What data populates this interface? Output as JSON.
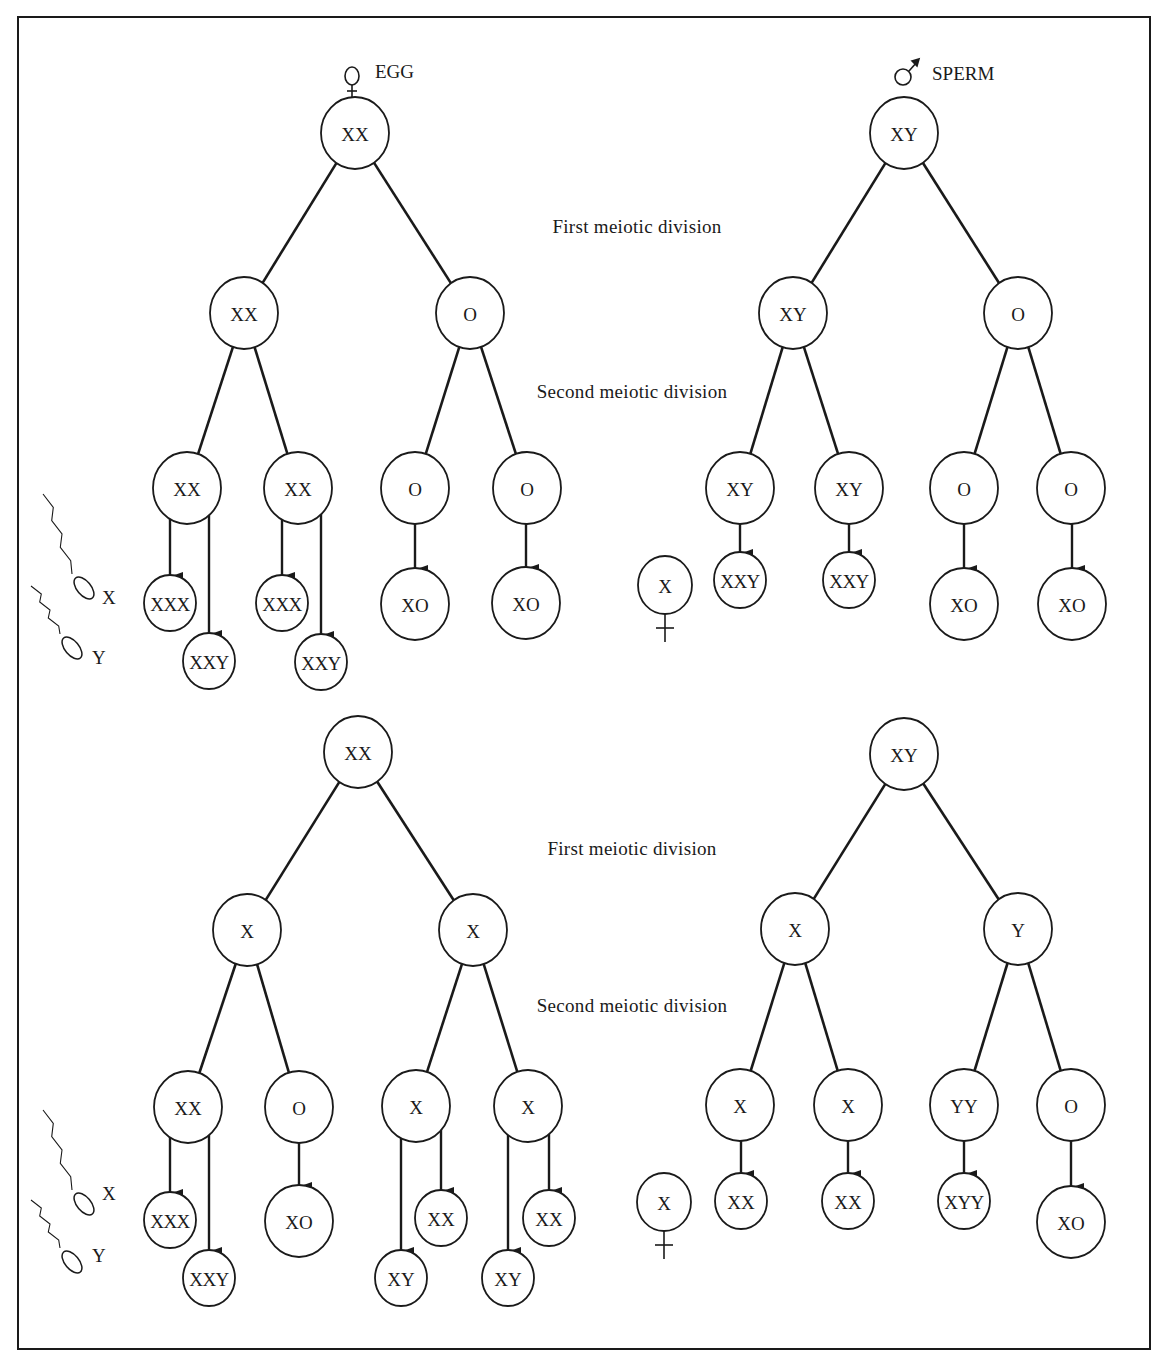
{
  "headers": {
    "egg": {
      "label": "EGG",
      "icon": "female-symbol",
      "x": 375,
      "y": 78
    },
    "sperm": {
      "label": "SPERM",
      "icon": "male-symbol",
      "x": 932,
      "y": 80
    }
  },
  "captions": [
    {
      "text": "First meiotic division",
      "x": 637,
      "y": 233
    },
    {
      "text": "Second meiotic division",
      "x": 632,
      "y": 398
    },
    {
      "text": "First meiotic division",
      "x": 632,
      "y": 855
    },
    {
      "text": "Second meiotic division",
      "x": 632,
      "y": 1012
    }
  ],
  "sperm_legend": [
    {
      "label": "X",
      "head_x": 84,
      "head_y": 588,
      "text_x": 102,
      "text_y": 604
    },
    {
      "label": "Y",
      "head_x": 72,
      "head_y": 648,
      "text_x": 92,
      "text_y": 664
    },
    {
      "label": "X",
      "head_x": 84,
      "head_y": 1204,
      "text_x": 102,
      "text_y": 1200
    },
    {
      "label": "Y",
      "head_x": 72,
      "head_y": 1262,
      "text_x": 92,
      "text_y": 1262
    }
  ],
  "female_ova": [
    {
      "label": "X",
      "x": 665,
      "y": 585,
      "r": 27
    },
    {
      "label": "X",
      "x": 664,
      "y": 1202,
      "r": 27
    }
  ],
  "trees": [
    {
      "name": "egg-nondisjunction-first-division",
      "nodes": [
        {
          "id": "r",
          "label": "XX",
          "x": 355,
          "y": 133,
          "r": 34
        },
        {
          "id": "a",
          "label": "XX",
          "x": 244,
          "y": 313,
          "r": 34
        },
        {
          "id": "b",
          "label": "O",
          "x": 470,
          "y": 313,
          "r": 34
        },
        {
          "id": "a1",
          "label": "XX",
          "x": 187,
          "y": 488,
          "r": 34
        },
        {
          "id": "a2",
          "label": "XX",
          "x": 298,
          "y": 488,
          "r": 34
        },
        {
          "id": "b1",
          "label": "O",
          "x": 415,
          "y": 488,
          "r": 34
        },
        {
          "id": "b2",
          "label": "O",
          "x": 527,
          "y": 488,
          "r": 34
        },
        {
          "id": "p1",
          "label": "XXX",
          "x": 170,
          "y": 603,
          "r": 26
        },
        {
          "id": "p2",
          "label": "XXY",
          "x": 209,
          "y": 661,
          "r": 26
        },
        {
          "id": "p3",
          "label": "XXX",
          "x": 282,
          "y": 603,
          "r": 26
        },
        {
          "id": "p4",
          "label": "XXY",
          "x": 321,
          "y": 662,
          "r": 26
        },
        {
          "id": "p5",
          "label": "XO",
          "x": 415,
          "y": 604,
          "r": 34
        },
        {
          "id": "p6",
          "label": "XO",
          "x": 526,
          "y": 603,
          "r": 34
        }
      ],
      "lines": [
        [
          "r",
          "a"
        ],
        [
          "r",
          "b"
        ],
        [
          "a",
          "a1"
        ],
        [
          "a",
          "a2"
        ],
        [
          "b",
          "b1"
        ],
        [
          "b",
          "b2"
        ]
      ],
      "arrows": [
        [
          "a1",
          "p1"
        ],
        [
          "a1",
          "p2"
        ],
        [
          "a2",
          "p3"
        ],
        [
          "a2",
          "p4"
        ],
        [
          "b1",
          "p5"
        ],
        [
          "b2",
          "p6"
        ]
      ]
    },
    {
      "name": "sperm-nondisjunction-first-division",
      "nodes": [
        {
          "id": "r",
          "label": "XY",
          "x": 904,
          "y": 133,
          "r": 34
        },
        {
          "id": "a",
          "label": "XY",
          "x": 793,
          "y": 313,
          "r": 34
        },
        {
          "id": "b",
          "label": "O",
          "x": 1018,
          "y": 313,
          "r": 34
        },
        {
          "id": "a1",
          "label": "XY",
          "x": 740,
          "y": 488,
          "r": 34
        },
        {
          "id": "a2",
          "label": "XY",
          "x": 849,
          "y": 488,
          "r": 34
        },
        {
          "id": "b1",
          "label": "O",
          "x": 964,
          "y": 488,
          "r": 34
        },
        {
          "id": "b2",
          "label": "O",
          "x": 1071,
          "y": 488,
          "r": 34
        },
        {
          "id": "p1",
          "label": "XXY",
          "x": 740,
          "y": 580,
          "r": 26
        },
        {
          "id": "p2",
          "label": "XXY",
          "x": 849,
          "y": 580,
          "r": 26
        },
        {
          "id": "p3",
          "label": "XO",
          "x": 964,
          "y": 604,
          "r": 34
        },
        {
          "id": "p4",
          "label": "XO",
          "x": 1072,
          "y": 604,
          "r": 34
        }
      ],
      "lines": [
        [
          "r",
          "a"
        ],
        [
          "r",
          "b"
        ],
        [
          "a",
          "a1"
        ],
        [
          "a",
          "a2"
        ],
        [
          "b",
          "b1"
        ],
        [
          "b",
          "b2"
        ]
      ],
      "arrows": [
        [
          "a1",
          "p1"
        ],
        [
          "a2",
          "p2"
        ],
        [
          "b1",
          "p3"
        ],
        [
          "b2",
          "p4"
        ]
      ]
    },
    {
      "name": "egg-nondisjunction-second-division",
      "nodes": [
        {
          "id": "r",
          "label": "XX",
          "x": 358,
          "y": 752,
          "r": 34
        },
        {
          "id": "a",
          "label": "X",
          "x": 247,
          "y": 930,
          "r": 34
        },
        {
          "id": "b",
          "label": "X",
          "x": 473,
          "y": 930,
          "r": 34
        },
        {
          "id": "a1",
          "label": "XX",
          "x": 188,
          "y": 1107,
          "r": 34
        },
        {
          "id": "a2",
          "label": "O",
          "x": 299,
          "y": 1107,
          "r": 34
        },
        {
          "id": "b1",
          "label": "X",
          "x": 416,
          "y": 1106,
          "r": 34
        },
        {
          "id": "b2",
          "label": "X",
          "x": 528,
          "y": 1106,
          "r": 34
        },
        {
          "id": "p1",
          "label": "XXX",
          "x": 170,
          "y": 1220,
          "r": 26
        },
        {
          "id": "p2",
          "label": "XXY",
          "x": 209,
          "y": 1278,
          "r": 26
        },
        {
          "id": "p3",
          "label": "XO",
          "x": 299,
          "y": 1221,
          "r": 34
        },
        {
          "id": "p4",
          "label": "XY",
          "x": 401,
          "y": 1278,
          "r": 26
        },
        {
          "id": "p5",
          "label": "XX",
          "x": 441,
          "y": 1218,
          "r": 26
        },
        {
          "id": "p6",
          "label": "XY",
          "x": 508,
          "y": 1278,
          "r": 26
        },
        {
          "id": "p7",
          "label": "XX",
          "x": 549,
          "y": 1218,
          "r": 26
        }
      ],
      "lines": [
        [
          "r",
          "a"
        ],
        [
          "r",
          "b"
        ],
        [
          "a",
          "a1"
        ],
        [
          "a",
          "a2"
        ],
        [
          "b",
          "b1"
        ],
        [
          "b",
          "b2"
        ]
      ],
      "arrows": [
        [
          "a1",
          "p1"
        ],
        [
          "a1",
          "p2"
        ],
        [
          "a2",
          "p3"
        ],
        [
          "b1",
          "p4"
        ],
        [
          "b1",
          "p5"
        ],
        [
          "b2",
          "p6"
        ],
        [
          "b2",
          "p7"
        ]
      ]
    },
    {
      "name": "sperm-nondisjunction-second-division",
      "nodes": [
        {
          "id": "r",
          "label": "XY",
          "x": 904,
          "y": 754,
          "r": 34
        },
        {
          "id": "a",
          "label": "X",
          "x": 795,
          "y": 929,
          "r": 34
        },
        {
          "id": "b",
          "label": "Y",
          "x": 1018,
          "y": 929,
          "r": 34
        },
        {
          "id": "a1",
          "label": "X",
          "x": 740,
          "y": 1105,
          "r": 34
        },
        {
          "id": "a2",
          "label": "X",
          "x": 848,
          "y": 1105,
          "r": 34
        },
        {
          "id": "b1",
          "label": "YY",
          "x": 964,
          "y": 1105,
          "r": 34
        },
        {
          "id": "b2",
          "label": "O",
          "x": 1071,
          "y": 1105,
          "r": 34
        },
        {
          "id": "p1",
          "label": "XX",
          "x": 741,
          "y": 1201,
          "r": 26
        },
        {
          "id": "p2",
          "label": "XX",
          "x": 848,
          "y": 1201,
          "r": 26
        },
        {
          "id": "p3",
          "label": "XYY",
          "x": 964,
          "y": 1201,
          "r": 26
        },
        {
          "id": "p4",
          "label": "XO",
          "x": 1071,
          "y": 1222,
          "r": 34
        }
      ],
      "lines": [
        [
          "r",
          "a"
        ],
        [
          "r",
          "b"
        ],
        [
          "a",
          "a1"
        ],
        [
          "a",
          "a2"
        ],
        [
          "b",
          "b1"
        ],
        [
          "b",
          "b2"
        ]
      ],
      "arrows": [
        [
          "a1",
          "p1"
        ],
        [
          "a2",
          "p2"
        ],
        [
          "b1",
          "p3"
        ],
        [
          "b2",
          "p4"
        ]
      ]
    }
  ],
  "colors": {
    "ink": "#1a1a1a",
    "background": "#ffffff"
  }
}
